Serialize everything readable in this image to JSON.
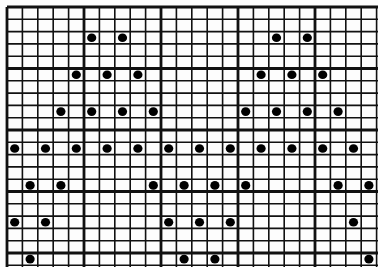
{
  "figure": {
    "grid": {
      "origin_x": 7,
      "origin_y": 7,
      "cell_w": 15.4,
      "cell_h": 12.3,
      "cols": 24,
      "rows": 21,
      "major_every": 5,
      "line_color": "#111111",
      "minor_width": 1.6,
      "major_width": 2.8
    },
    "dot_color": "#000000",
    "dot_radius": 4.3,
    "dots": [
      [
        5,
        2
      ],
      [
        7,
        2
      ],
      [
        17,
        2
      ],
      [
        19,
        2
      ],
      [
        4,
        5
      ],
      [
        6,
        5
      ],
      [
        8,
        5
      ],
      [
        16,
        5
      ],
      [
        18,
        5
      ],
      [
        20,
        5
      ],
      [
        3,
        8
      ],
      [
        5,
        8
      ],
      [
        7,
        8
      ],
      [
        9,
        8
      ],
      [
        15,
        8
      ],
      [
        17,
        8
      ],
      [
        19,
        8
      ],
      [
        21,
        8
      ],
      [
        0,
        11
      ],
      [
        2,
        11
      ],
      [
        4,
        11
      ],
      [
        6,
        11
      ],
      [
        8,
        11
      ],
      [
        10,
        11
      ],
      [
        12,
        11
      ],
      [
        14,
        11
      ],
      [
        16,
        11
      ],
      [
        18,
        11
      ],
      [
        20,
        11
      ],
      [
        22,
        11
      ],
      [
        1,
        14
      ],
      [
        3,
        14
      ],
      [
        9,
        14
      ],
      [
        11,
        14
      ],
      [
        13,
        14
      ],
      [
        15,
        14
      ],
      [
        21,
        14
      ],
      [
        23,
        14
      ],
      [
        0,
        17
      ],
      [
        2,
        17
      ],
      [
        10,
        17
      ],
      [
        12,
        17
      ],
      [
        14,
        17
      ],
      [
        22,
        17
      ],
      [
        1,
        20
      ],
      [
        11,
        20
      ],
      [
        13,
        20
      ],
      [
        23,
        20
      ]
    ]
  }
}
